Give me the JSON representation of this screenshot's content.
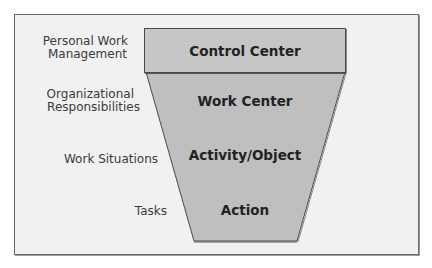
{
  "diagram": {
    "type": "funnel",
    "levels": [
      {
        "label": "Control Center",
        "category": "Personal Work\nManagement"
      },
      {
        "label": "Work Center",
        "category": "Organizational\nResponsibilities"
      },
      {
        "label": "Activity/Object",
        "category": "Work Situations"
      },
      {
        "label": "Action",
        "category": "Tasks"
      }
    ],
    "categories": {
      "c0_line1": "Personal Work",
      "c0_line2": "Management",
      "c1_line1": "Organizational",
      "c1_line2": "Responsibilities",
      "c2": "Work Situations",
      "c3": "Tasks"
    },
    "colors": {
      "background": "#f1f1f1",
      "box_fill": "#c6c6c6",
      "funnel_fill": "#bfbfbf",
      "border": "#4a4a4a"
    }
  }
}
